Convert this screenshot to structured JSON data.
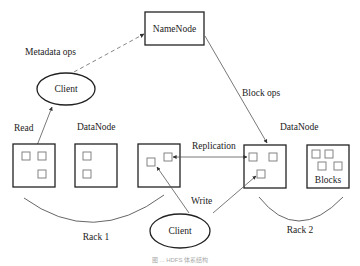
{
  "diagram": {
    "namenode": {
      "label": "NameNode"
    },
    "clients": [
      {
        "label": "Client",
        "position": "upper-left"
      },
      {
        "label": "Client",
        "position": "bottom-center"
      }
    ],
    "edge_labels": {
      "metadata_ops": "Metadata ops",
      "block_ops": "Block ops",
      "read": "Read",
      "write": "Write",
      "replication": "Replication"
    },
    "datanode_labels": [
      "DataNode",
      "DataNode"
    ],
    "blocks_label": "Blocks",
    "racks": [
      {
        "label": "Rack 1",
        "datanodes": 3
      },
      {
        "label": "Rack 2",
        "datanodes": 2
      }
    ],
    "caption": "图 ... HDFS 体系结构"
  }
}
